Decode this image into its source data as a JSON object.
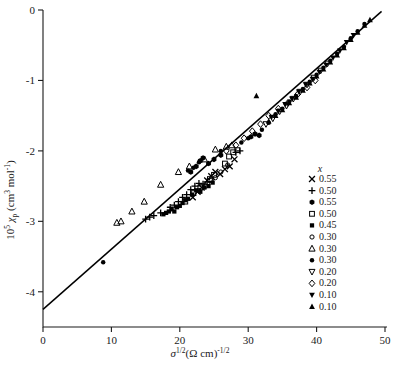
{
  "chart_data": {
    "type": "scatter",
    "title": "",
    "xlabel": "sigma^(1/2) (Ohm cm)^(-1/2)",
    "ylabel": "10^5 chi_p (cm^3 mol^-1)",
    "xlim": [
      0,
      50
    ],
    "ylim": [
      -4.5,
      0
    ],
    "grid": false,
    "legend_position": "inside-right",
    "axis": {
      "x_ticks": [
        "0",
        "10",
        "20",
        "30",
        "40",
        "50"
      ],
      "x_tick_values": [
        0,
        10,
        20,
        30,
        40,
        50
      ],
      "y_ticks": [
        "0",
        "-1",
        "-2",
        "-3",
        "-4"
      ],
      "y_tick_values": [
        0,
        -1,
        -2,
        -3,
        -4
      ],
      "x_label_parts": {
        "sigma": "σ",
        "sigma_exp": "1/2",
        "paren": "(Ω cm)",
        "paren_exp": "-1/2"
      },
      "y_label_parts": {
        "prefix": "10",
        "prefix_exp": "5",
        "chi": "χ",
        "chi_sub": "p",
        "units": "(cm",
        "units_exp1": "3",
        "units_mid": " mol",
        "units_exp2": "-1",
        "units_close": ")"
      }
    },
    "fit_line": {
      "label": "linear fit",
      "x1": 0,
      "y1": -4.25,
      "x2": 49.5,
      "y2": -0.02,
      "slope": 0.0854,
      "intercept": -4.25,
      "color": "#000000"
    },
    "legend_header": "x",
    "series": [
      {
        "name": "0.55-cross",
        "label": "0.55",
        "marker": "x-cross",
        "filled": true,
        "color": "#000000",
        "size": 4.2,
        "points": [
          [
            24.0,
            -2.42
          ],
          [
            24.6,
            -2.36
          ],
          [
            25.2,
            -2.3
          ],
          [
            25.9,
            -2.33
          ],
          [
            26.6,
            -2.26
          ],
          [
            23.2,
            -2.52
          ],
          [
            22.6,
            -2.58
          ],
          [
            27.3,
            -2.22
          ],
          [
            21.9,
            -2.66
          ],
          [
            28.0,
            -2.12
          ]
        ]
      },
      {
        "name": "0.50-plus",
        "label": "0.50",
        "marker": "plus",
        "filled": true,
        "color": "#000000",
        "size": 4.2,
        "points": [
          [
            15.0,
            -2.97
          ],
          [
            15.6,
            -2.94
          ],
          [
            16.2,
            -2.92
          ],
          [
            18.6,
            -2.8
          ],
          [
            19.2,
            -2.77
          ],
          [
            19.8,
            -2.72
          ],
          [
            20.4,
            -2.66
          ],
          [
            21.0,
            -2.62
          ],
          [
            21.6,
            -2.55
          ],
          [
            22.2,
            -2.5
          ],
          [
            22.8,
            -2.46
          ],
          [
            23.4,
            -2.47
          ],
          [
            24.0,
            -2.44
          ],
          [
            17.2,
            -2.88
          ],
          [
            28.2,
            -2.02
          ],
          [
            28.8,
            -2.0
          ]
        ]
      },
      {
        "name": "0.55-filled-hex",
        "label": "0.55",
        "marker": "hexagon-filled",
        "filled": true,
        "color": "#000000",
        "size": 4.0,
        "points": [
          [
            23.0,
            -2.14
          ],
          [
            23.4,
            -2.1
          ],
          [
            22.4,
            -2.22
          ],
          [
            24.2,
            -2.18
          ],
          [
            21.6,
            -2.3
          ],
          [
            25.0,
            -2.12
          ],
          [
            26.0,
            -2.06
          ],
          [
            30.4,
            -1.8
          ],
          [
            31.0,
            -1.76
          ],
          [
            31.6,
            -1.78
          ]
        ]
      },
      {
        "name": "0.50-opensquare",
        "label": "0.50",
        "marker": "square-open",
        "filled": false,
        "color": "#000000",
        "size": 4.0,
        "points": [
          [
            27.2,
            -2.08
          ],
          [
            27.8,
            -2.02
          ],
          [
            28.4,
            -1.99
          ],
          [
            26.6,
            -2.18
          ],
          [
            25.0,
            -2.34
          ],
          [
            24.4,
            -2.4
          ],
          [
            23.0,
            -2.52
          ],
          [
            22.0,
            -2.6
          ],
          [
            20.8,
            -2.72
          ]
        ]
      },
      {
        "name": "0.45-filledsquare",
        "label": "0.45",
        "marker": "square-filled",
        "filled": true,
        "color": "#000000",
        "size": 3.8,
        "points": [
          [
            18.4,
            -2.86
          ],
          [
            18.8,
            -2.83
          ],
          [
            19.2,
            -2.86
          ],
          [
            19.6,
            -2.8
          ],
          [
            20.0,
            -2.78
          ],
          [
            20.4,
            -2.74
          ],
          [
            20.8,
            -2.7
          ],
          [
            21.2,
            -2.68
          ],
          [
            21.8,
            -2.62
          ],
          [
            22.4,
            -2.56
          ],
          [
            23.0,
            -2.58
          ],
          [
            23.6,
            -2.52
          ],
          [
            24.2,
            -2.5
          ],
          [
            18.0,
            -2.88
          ],
          [
            17.6,
            -2.9
          ],
          [
            24.8,
            -2.45
          ]
        ]
      },
      {
        "name": "0.30-opencircle",
        "label": "0.30",
        "marker": "circle-open",
        "filled": false,
        "color": "#000000",
        "size": 3.4,
        "points": [
          [
            24.6,
            -2.42
          ],
          [
            25.2,
            -2.38
          ],
          [
            26.0,
            -2.3
          ],
          [
            23.8,
            -2.5
          ],
          [
            27.0,
            -2.2
          ],
          [
            22.8,
            -2.56
          ]
        ]
      },
      {
        "name": "0.30-opentriangle",
        "label": "0.30",
        "marker": "triangle-open",
        "filled": false,
        "color": "#000000",
        "size": 4.2,
        "points": [
          [
            10.8,
            -3.02
          ],
          [
            11.4,
            -3.0
          ],
          [
            13.0,
            -2.86
          ],
          [
            14.8,
            -2.72
          ],
          [
            17.2,
            -2.48
          ],
          [
            19.8,
            -2.3
          ],
          [
            21.4,
            -2.22
          ],
          [
            23.6,
            -2.12
          ],
          [
            25.2,
            -1.98
          ],
          [
            26.8,
            -1.94
          ],
          [
            27.6,
            -1.92
          ]
        ]
      },
      {
        "name": "0.30-filledcircle",
        "label": "0.30",
        "marker": "circle-filled",
        "filled": true,
        "color": "#000000",
        "size": 3.6,
        "points": [
          [
            8.8,
            -3.58
          ],
          [
            21.2,
            -2.28
          ],
          [
            22.0,
            -2.24
          ],
          [
            22.8,
            -2.16
          ],
          [
            26.0,
            -2.0
          ],
          [
            29.0,
            -1.88
          ],
          [
            30.0,
            -1.82
          ],
          [
            32.0,
            -1.7
          ],
          [
            33.0,
            -1.6
          ],
          [
            34.0,
            -1.48
          ],
          [
            35.0,
            -1.4
          ],
          [
            36.0,
            -1.3
          ],
          [
            37.0,
            -1.22
          ],
          [
            38.0,
            -1.12
          ],
          [
            39.0,
            -1.02
          ],
          [
            40.0,
            -0.92
          ],
          [
            41.0,
            -0.82
          ],
          [
            42.0,
            -0.72
          ],
          [
            43.0,
            -0.62
          ],
          [
            44.0,
            -0.52
          ],
          [
            45.0,
            -0.4
          ],
          [
            46.0,
            -0.3
          ],
          [
            47.0,
            -0.2
          ]
        ]
      },
      {
        "name": "0.20-opendowntriangle",
        "label": "0.20",
        "marker": "triangle-down-open",
        "filled": false,
        "color": "#000000",
        "size": 4.0,
        "points": [
          [
            32.6,
            -1.62
          ],
          [
            33.6,
            -1.54
          ],
          [
            34.6,
            -1.44
          ],
          [
            35.6,
            -1.36
          ],
          [
            36.6,
            -1.26
          ],
          [
            37.6,
            -1.16
          ],
          [
            38.6,
            -1.06
          ],
          [
            39.6,
            -0.96
          ],
          [
            40.6,
            -0.86
          ],
          [
            41.6,
            -0.76
          ]
        ]
      },
      {
        "name": "0.20-opendiamond",
        "label": "0.20",
        "marker": "diamond-open",
        "filled": false,
        "color": "#000000",
        "size": 4.2,
        "points": [
          [
            28.2,
            -1.92
          ],
          [
            29.4,
            -1.82
          ],
          [
            30.6,
            -1.72
          ],
          [
            31.8,
            -1.62
          ],
          [
            33.0,
            -1.5
          ],
          [
            34.4,
            -1.4
          ],
          [
            35.8,
            -1.32
          ],
          [
            37.2,
            -1.2
          ],
          [
            38.6,
            -1.1
          ],
          [
            39.8,
            -1.0
          ],
          [
            26.8,
            -2.0
          ]
        ]
      },
      {
        "name": "0.10-filleddowntriangle",
        "label": "0.10",
        "marker": "triangle-down-filled",
        "filled": true,
        "color": "#000000",
        "size": 4.0,
        "points": [
          [
            33.4,
            -1.52
          ],
          [
            34.4,
            -1.44
          ],
          [
            35.4,
            -1.34
          ],
          [
            36.4,
            -1.26
          ],
          [
            37.4,
            -1.16
          ],
          [
            38.4,
            -1.06
          ],
          [
            39.4,
            -0.98
          ],
          [
            40.4,
            -0.88
          ],
          [
            41.4,
            -0.78
          ],
          [
            42.4,
            -0.68
          ],
          [
            43.4,
            -0.58
          ],
          [
            44.4,
            -0.46
          ],
          [
            45.4,
            -0.36
          ]
        ]
      },
      {
        "name": "0.10-filledtriangle",
        "label": "0.10",
        "marker": "triangle-filled",
        "filled": true,
        "color": "#000000",
        "size": 4.0,
        "points": [
          [
            31.2,
            -1.22
          ],
          [
            33.0,
            -1.58
          ],
          [
            34.0,
            -1.5
          ],
          [
            35.0,
            -1.42
          ],
          [
            36.0,
            -1.32
          ],
          [
            37.0,
            -1.24
          ],
          [
            38.0,
            -1.14
          ],
          [
            39.0,
            -1.04
          ],
          [
            40.0,
            -0.94
          ],
          [
            41.0,
            -0.84
          ],
          [
            42.0,
            -0.74
          ],
          [
            43.0,
            -0.64
          ],
          [
            44.0,
            -0.54
          ],
          [
            45.0,
            -0.42
          ],
          [
            46.0,
            -0.32
          ],
          [
            47.0,
            -0.22
          ],
          [
            47.8,
            -0.14
          ]
        ]
      }
    ]
  }
}
